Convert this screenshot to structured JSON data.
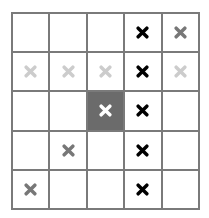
{
  "board": {
    "rows": 5,
    "cols": 5,
    "colors": {
      "grid_line": "#7a7a7a",
      "cell_bg": "#ffffff",
      "filled_cell_bg": "#6b6b6b"
    },
    "cells": [
      [
        {
          "mark": "none"
        },
        {
          "mark": "none"
        },
        {
          "mark": "none"
        },
        {
          "mark": "x",
          "color": "#000000"
        },
        {
          "mark": "x",
          "color": "#777777"
        }
      ],
      [
        {
          "mark": "x",
          "color": "#cccccc"
        },
        {
          "mark": "x",
          "color": "#cccccc"
        },
        {
          "mark": "x",
          "color": "#cccccc"
        },
        {
          "mark": "x",
          "color": "#000000"
        },
        {
          "mark": "x",
          "color": "#cccccc"
        }
      ],
      [
        {
          "mark": "none"
        },
        {
          "mark": "none"
        },
        {
          "mark": "x",
          "color": "#ffffff",
          "filled": true
        },
        {
          "mark": "x",
          "color": "#000000"
        },
        {
          "mark": "none"
        }
      ],
      [
        {
          "mark": "none"
        },
        {
          "mark": "x",
          "color": "#777777"
        },
        {
          "mark": "none"
        },
        {
          "mark": "x",
          "color": "#000000"
        },
        {
          "mark": "none"
        }
      ],
      [
        {
          "mark": "x",
          "color": "#777777"
        },
        {
          "mark": "none"
        },
        {
          "mark": "none"
        },
        {
          "mark": "x",
          "color": "#000000"
        },
        {
          "mark": "none"
        }
      ]
    ]
  }
}
